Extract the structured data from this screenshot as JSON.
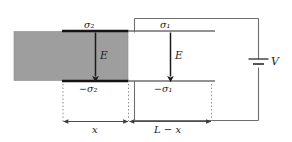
{
  "figure": {
    "type": "physics-diagram",
    "background_color": "#ffffff",
    "colors": {
      "slab_fill": "#9e9e9e",
      "slab_edge": "#707070",
      "plate_thick": "#141414",
      "plate_thin": "#6e6e6e",
      "wire": "#6e6e6e",
      "arrow": "#1a1a1a",
      "dotted_guide": "#8a8a8a",
      "text": "#1a1a1a"
    },
    "labels": {
      "sigma_top_left": "σ₂",
      "sigma_top_right": "σ₁",
      "sigma_bottom_left": "−σ₂",
      "sigma_bottom_right": "−σ₁",
      "field_left": "E",
      "field_right": "E",
      "voltage": "V",
      "dim_left": "x",
      "dim_right": "L − x"
    },
    "elements": {
      "slab_name": "dielectric-slab",
      "battery_name": "battery-symbol",
      "field_arrow_left_name": "field-arrow-left",
      "field_arrow_right_name": "field-arrow-right"
    }
  }
}
